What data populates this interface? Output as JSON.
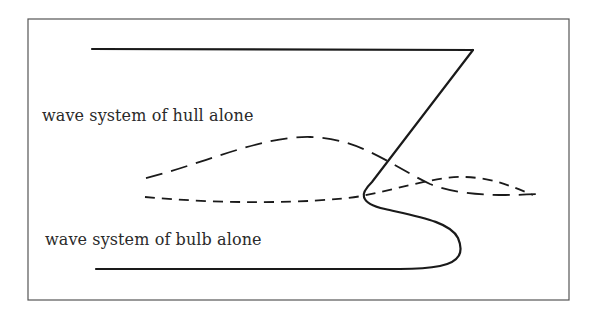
{
  "diagram": {
    "type": "ship-bow-wave-interference",
    "labels": {
      "hull_wave": "wave system of hull alone",
      "bulb_wave": "wave system of bulb alone"
    },
    "elements": [
      {
        "name": "frame",
        "style": "solid thin border"
      },
      {
        "name": "deck-line",
        "style": "solid"
      },
      {
        "name": "stem-line",
        "style": "solid"
      },
      {
        "name": "bulbous-bow-outline",
        "style": "solid"
      },
      {
        "name": "keel-line",
        "style": "solid"
      },
      {
        "name": "hull-wave-curve",
        "style": "long dashed"
      },
      {
        "name": "bulb-wave-curve",
        "style": "short dashed"
      }
    ],
    "colors": {
      "stroke": "#1a1a1a",
      "frame": "#555555",
      "background": "#ffffff"
    }
  }
}
